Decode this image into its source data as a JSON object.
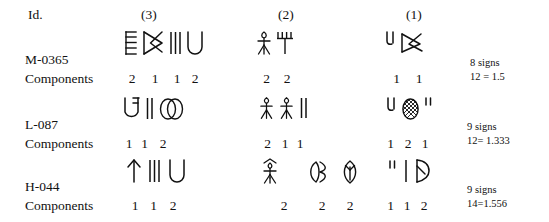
{
  "table": {
    "header": {
      "id_label": "Id.",
      "col3_label": "(3)",
      "col2_label": "(2)",
      "col1_label": "(1)"
    },
    "components_label": "Components",
    "rows": [
      {
        "id": "M-0365",
        "col3": {
          "group_label": "(3)",
          "signs": [
            "ladder",
            "hourglass-x",
            "three-strokes",
            "u-cup"
          ],
          "components": [
            "2",
            "1",
            "1",
            "2"
          ]
        },
        "col2": {
          "group_label": "(2)",
          "signs": [
            "standing-figure",
            "rake-comb"
          ],
          "components": [
            "2",
            "2"
          ]
        },
        "col1": {
          "group_label": "(1)",
          "signs": [
            "hook-stroke",
            "bowtie-x"
          ],
          "components": [
            "1",
            "1"
          ]
        },
        "notes": {
          "signs_count": "8 signs",
          "ratio": "12 = 1.5"
        }
      },
      {
        "id": "L-087",
        "col3": {
          "group_label": "(3)",
          "signs": [
            "u-with-flag",
            "two-strokes",
            "double-oval"
          ],
          "components": [
            "1",
            "1",
            "2"
          ]
        },
        "col2": {
          "group_label": "(2)",
          "signs": [
            "standing-figure",
            "standing-figure",
            "two-strokes"
          ],
          "components": [
            "2",
            "1",
            "1"
          ]
        },
        "col1": {
          "group_label": "(1)",
          "signs": [
            "hook-stroke",
            "hatched-oval",
            "double-quote"
          ],
          "components": [
            "1",
            "2",
            "1"
          ]
        },
        "notes": {
          "signs_count": "9 signs",
          "ratio": "12= 1.333"
        }
      },
      {
        "id": "H-044",
        "col3": {
          "group_label": "(3)",
          "signs": [
            "arrow-up",
            "three-strokes",
            "u-cup"
          ],
          "components": [
            "1",
            "1",
            "2"
          ]
        },
        "col2": {
          "group_label": "(2)",
          "signs": [
            "crowned-figure",
            "double-leaf",
            "leaf-with-stem"
          ],
          "components": [
            "2",
            "2",
            "2"
          ]
        },
        "col1": {
          "group_label": "(1)",
          "signs": [
            "double-quote",
            "single-stroke",
            "flag-loop"
          ],
          "components": [
            "1",
            "1",
            "2"
          ]
        },
        "notes": {
          "signs_count": "9 signs",
          "ratio": "14=1.556"
        }
      }
    ]
  }
}
